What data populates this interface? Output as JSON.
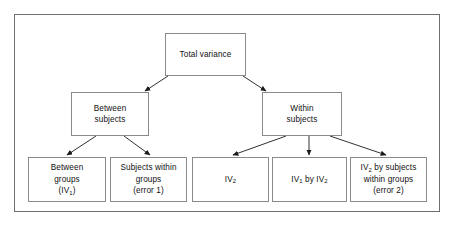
{
  "diagram": {
    "frame": {
      "border_color": "#6f6f6f"
    },
    "box_border_color": "#8a8a8a",
    "text_color": "#111111",
    "background": "#ffffff",
    "nodes": [
      {
        "id": "total",
        "label": "Total variance",
        "level": "root"
      },
      {
        "id": "between",
        "label": "Between\nsubjects",
        "level": "branch"
      },
      {
        "id": "within",
        "label": "Within\nsubjects",
        "level": "branch"
      },
      {
        "id": "leaf1",
        "label": "Between\ngroups\n(IV1)",
        "level": "leaf"
      },
      {
        "id": "leaf2",
        "label": "Subjects within\ngroups\n(error 1)",
        "level": "leaf"
      },
      {
        "id": "leaf3",
        "label": "IV2",
        "level": "leaf"
      },
      {
        "id": "leaf4",
        "label": "IV1 by IV2",
        "level": "leaf"
      },
      {
        "id": "leaf5",
        "label": "IV2 by subjects\nwithin groups\n(error 2)",
        "level": "leaf"
      }
    ],
    "edges": [
      {
        "from": "total",
        "to": "between",
        "arrow": "down-left"
      },
      {
        "from": "total",
        "to": "within",
        "arrow": "down-right"
      },
      {
        "from": "between",
        "to": "leaf1",
        "arrow": "down-left"
      },
      {
        "from": "between",
        "to": "leaf2",
        "arrow": "down-right"
      },
      {
        "from": "within",
        "to": "leaf3",
        "arrow": "down-left"
      },
      {
        "from": "within",
        "to": "leaf4",
        "arrow": "down"
      },
      {
        "from": "within",
        "to": "leaf5",
        "arrow": "down-right"
      }
    ]
  }
}
